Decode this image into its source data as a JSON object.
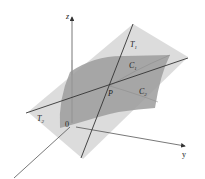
{
  "diagram": {
    "labels": {
      "z_axis": "z",
      "y_axis": "y",
      "x_axis": "x",
      "origin": "0",
      "point": "P",
      "tangent_line_1": "T",
      "tangent_line_1_sub": "1",
      "tangent_line_2": "T",
      "tangent_line_2_sub": "2",
      "curve_1": "C",
      "curve_1_sub": "1",
      "curve_2": "C",
      "curve_2_sub": "2"
    },
    "colors": {
      "tangent_plane": "#d4d4d4",
      "surface": "#9a9a9a",
      "lines": "#333333",
      "axes": "#555555"
    }
  }
}
